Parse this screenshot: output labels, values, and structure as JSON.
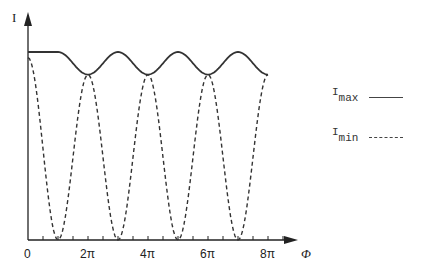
{
  "chart_data": {
    "type": "line",
    "title": "",
    "xlabel": "Φ",
    "ylabel": "I",
    "x_ticks": [
      "0",
      "2π",
      "4π",
      "6π",
      "8π"
    ],
    "x_tick_values_pi": [
      0,
      2,
      4,
      6,
      8
    ],
    "minor_tick_step_pi": 0.5,
    "xlim_pi": [
      0,
      8.8
    ],
    "ylim": [
      0,
      1.05
    ],
    "grid": false,
    "legend_position": "right",
    "series": [
      {
        "name": "I_max",
        "style": "solid",
        "description": "Flat at 1.0 from 0 to ~π, then oscillates between 1.0 (maxima at 3π, 5π, 7π) and ~0.88 (minima at 2π, 4π, 6π, 8π)",
        "x_pi": [
          0,
          1,
          2,
          3,
          4,
          5,
          6,
          7,
          8
        ],
        "values": [
          1.0,
          1.0,
          0.88,
          1.0,
          0.88,
          1.0,
          0.88,
          1.0,
          0.88
        ]
      },
      {
        "name": "I_min",
        "style": "dashed",
        "description": "Oscillates between 0 (minima at π, 3π, 5π, 7π) and the I_max envelope (peaks at 0, 2π, 4π, 6π, 8π)",
        "x_pi": [
          0,
          1,
          2,
          3,
          4,
          5,
          6,
          7,
          8
        ],
        "values": [
          0.97,
          0.0,
          0.88,
          0.0,
          0.88,
          0.0,
          0.88,
          0.0,
          0.88
        ]
      }
    ]
  },
  "labels": {
    "y_axis": "I",
    "x_axis": "Φ",
    "ticks": [
      "0",
      "2π",
      "4π",
      "6π",
      "8π"
    ]
  },
  "legend": {
    "max": {
      "main": "I",
      "sub": "max"
    },
    "min": {
      "main": "I",
      "sub": "min"
    }
  }
}
